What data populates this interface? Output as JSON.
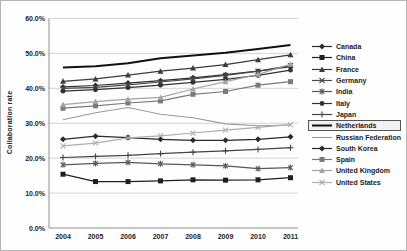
{
  "figure": {
    "y_axis_label": "Collaboration rate"
  },
  "chart_data": {
    "type": "line",
    "title": "",
    "xlabel": "",
    "ylabel": "Collaboration rate",
    "x": [
      "2004",
      "2005",
      "2006",
      "2007",
      "2008",
      "2009",
      "2010",
      "2011"
    ],
    "y_ticks": [
      "0.0%",
      "10.0%",
      "20.0%",
      "30.0%",
      "40.0%",
      "50.0%",
      "60.0%"
    ],
    "ylim": [
      0,
      60
    ],
    "grid": "horizontal",
    "legend_position": "right",
    "highlighted_series": "Netherlands",
    "series": [
      {
        "name": "Canada",
        "marker": "diamond",
        "color": "#2e2e2e",
        "width": 1.2,
        "values": [
          40.4,
          40.8,
          41.5,
          42.2,
          43.0,
          43.9,
          44.9,
          46.2
        ]
      },
      {
        "name": "China",
        "marker": "square",
        "color": "#1f1f1f",
        "width": 1.2,
        "values": [
          15.4,
          13.3,
          13.3,
          13.5,
          13.8,
          13.7,
          13.8,
          14.4
        ]
      },
      {
        "name": "France",
        "marker": "triangle",
        "color": "#3c3c3c",
        "width": 1.2,
        "values": [
          42.0,
          42.7,
          43.8,
          44.9,
          45.8,
          46.8,
          48.2,
          49.6
        ]
      },
      {
        "name": "Germany",
        "marker": "x",
        "color": "#4a4a4a",
        "width": 1.2,
        "values": [
          40.0,
          40.3,
          41.0,
          41.8,
          42.7,
          43.7,
          44.9,
          46.5
        ]
      },
      {
        "name": "India",
        "marker": "star",
        "color": "#585858",
        "width": 1.2,
        "values": [
          18.1,
          18.5,
          18.8,
          18.4,
          18.1,
          17.8,
          17.0,
          17.3
        ]
      },
      {
        "name": "Italy",
        "marker": "circle",
        "color": "#333333",
        "width": 1.2,
        "values": [
          39.2,
          39.6,
          40.2,
          40.9,
          41.7,
          42.6,
          43.7,
          45.2
        ]
      },
      {
        "name": "Japan",
        "marker": "plus",
        "color": "#454545",
        "width": 1.2,
        "values": [
          20.2,
          20.5,
          20.8,
          21.3,
          21.7,
          22.1,
          22.5,
          23.0
        ]
      },
      {
        "name": "Netherlands",
        "marker": "none",
        "color": "#111111",
        "width": 2.0,
        "values": [
          46.0,
          46.3,
          47.2,
          48.6,
          49.4,
          50.2,
          51.3,
          52.4
        ]
      },
      {
        "name": "Russian Federation",
        "marker": "none",
        "color": "#9a9a9a",
        "width": 1.1,
        "values": [
          31.0,
          33.0,
          34.5,
          32.6,
          31.6,
          29.8,
          29.3,
          29.5
        ]
      },
      {
        "name": "South Korea",
        "marker": "diamond",
        "color": "#2a2a2a",
        "width": 1.2,
        "values": [
          25.4,
          26.3,
          25.9,
          25.4,
          25.1,
          25.1,
          25.4,
          26.1
        ]
      },
      {
        "name": "Spain",
        "marker": "square",
        "color": "#7a7a7a",
        "width": 1.2,
        "values": [
          34.3,
          35.0,
          35.8,
          36.4,
          38.3,
          39.1,
          40.9,
          41.9
        ]
      },
      {
        "name": "United Kingdom",
        "marker": "triangle",
        "color": "#a3a3a3",
        "width": 1.2,
        "values": [
          35.3,
          36.2,
          36.9,
          37.4,
          39.8,
          41.9,
          44.0,
          46.9
        ]
      },
      {
        "name": "United States",
        "marker": "x",
        "color": "#aeaeae",
        "width": 1.2,
        "values": [
          23.5,
          24.3,
          25.8,
          26.4,
          27.2,
          28.0,
          28.8,
          29.6
        ]
      }
    ]
  }
}
